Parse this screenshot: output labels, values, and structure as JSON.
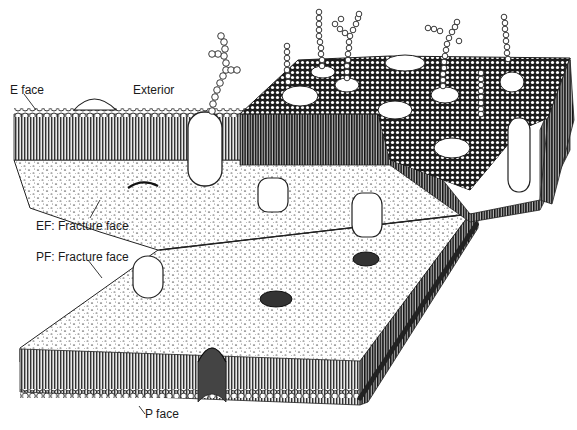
{
  "diagram": {
    "labels": {
      "e_face": "E face",
      "exterior": "Exterior",
      "ef_fracture": "EF: Fracture face",
      "pf_fracture": "PF: Fracture face",
      "p_face": "P face"
    },
    "colors": {
      "ink": "#1a1a1a",
      "paper": "#ffffff",
      "stipple": "#555555"
    },
    "components": [
      "outer leaflet surface (E face) with lipid head groups",
      "glycoprotein chains (beaded oligosaccharides)",
      "EF fracture face with pits",
      "PF fracture face with intramembrane particles and pits",
      "inner leaflet surface (P face)"
    ]
  }
}
